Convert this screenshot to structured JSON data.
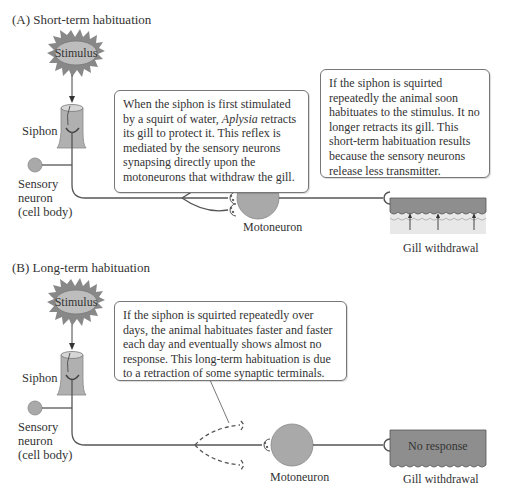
{
  "panel_a": {
    "title": "(A)  Short-term habituation",
    "stimulus_label": "Stimulus",
    "siphon_label": "Siphon",
    "sensory_neuron_label": [
      "Sensory",
      "neuron",
      "(cell body)"
    ],
    "callout_left": {
      "text_before_italic": "When the siphon is first stimulated by a squirt of water, ",
      "italic": "Aplysia",
      "text_after_italic": " retracts its gill to protect it. This reflex is mediated by the sensory neurons synapsing directly upon the motoneurons that withdraw the gill."
    },
    "callout_right": "If the siphon is squirted repeatedly the animal soon habituates to the stimulus. It no longer retracts its gill. This short-term habituation results because the sensory neurons release less transmitter.",
    "motoneuron_label": "Motoneuron",
    "gill_label": "Gill withdrawal"
  },
  "panel_b": {
    "title": "(B)  Long-term habituation",
    "stimulus_label": "Stimulus",
    "siphon_label": "Siphon",
    "sensory_neuron_label": [
      "Sensory",
      "neuron",
      "(cell body)"
    ],
    "callout": "If the siphon is squirted repeatedly over days, the animal habituates faster and faster each day and eventually shows almost no response. This long-term habituation is due to a retraction of some synaptic terminals.",
    "motoneuron_label": "Motoneuron",
    "gill_box_text": "No response",
    "gill_label": "Gill withdrawal"
  },
  "colors": {
    "neuron_fill": "#a9a9a9",
    "stimulus_fill": "#b9b9b9",
    "gill_dark": "#8c8c8c",
    "gill_light": "#e6e6e6",
    "line": "#555555"
  }
}
